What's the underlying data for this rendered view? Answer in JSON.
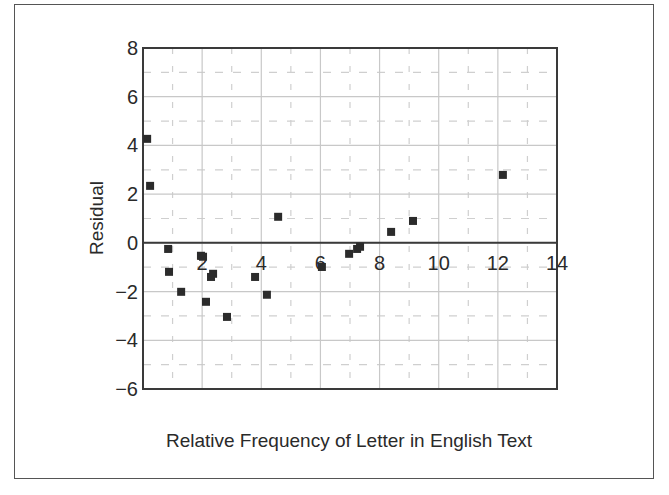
{
  "chart_data": {
    "type": "scatter",
    "title": "",
    "xlabel": "Relative Frequency of Letter in English Text",
    "ylabel": "Residual",
    "xlim": [
      0,
      14
    ],
    "ylim": [
      -6,
      8
    ],
    "x_ticks": [
      2,
      4,
      6,
      8,
      10,
      12,
      14
    ],
    "y_ticks": [
      8,
      6,
      4,
      2,
      0,
      -2,
      -4,
      -6
    ],
    "x_tick_labels": [
      "2",
      "4",
      "6",
      "8",
      "10",
      "12",
      "14"
    ],
    "y_tick_labels": [
      "8",
      "6",
      "4",
      "2",
      "0",
      "−2",
      "−4",
      "−6"
    ],
    "grid": {
      "major": "solid light gray every 2 units",
      "minor": "dashed light gray every 1 unit"
    },
    "legend": null,
    "marker": "square",
    "marker_color": "#2b2b2b",
    "points": [
      {
        "x": 0.14,
        "y": 4.27
      },
      {
        "x": 0.24,
        "y": 2.34
      },
      {
        "x": 0.85,
        "y": -0.25
      },
      {
        "x": 0.88,
        "y": -1.19
      },
      {
        "x": 1.29,
        "y": -2.01
      },
      {
        "x": 1.96,
        "y": -0.53
      },
      {
        "x": 2.03,
        "y": -0.57
      },
      {
        "x": 2.13,
        "y": -2.42
      },
      {
        "x": 2.3,
        "y": -1.4
      },
      {
        "x": 2.37,
        "y": -1.27
      },
      {
        "x": 2.84,
        "y": -3.04
      },
      {
        "x": 3.79,
        "y": -1.4
      },
      {
        "x": 4.19,
        "y": -2.13
      },
      {
        "x": 4.57,
        "y": 1.07
      },
      {
        "x": 6.05,
        "y": -0.99
      },
      {
        "x": 6.97,
        "y": -0.45
      },
      {
        "x": 7.24,
        "y": -0.25
      },
      {
        "x": 7.34,
        "y": -0.16
      },
      {
        "x": 8.39,
        "y": 0.45
      },
      {
        "x": 9.13,
        "y": 0.9
      },
      {
        "x": 12.17,
        "y": 2.79
      }
    ]
  },
  "colors": {
    "frame": "#555555",
    "axis": "#3a3a3a",
    "major_grid": "#c8c8c8",
    "minor_grid": "#cfcfcf",
    "marker": "#2b2b2b",
    "text": "#2a2a2a"
  }
}
